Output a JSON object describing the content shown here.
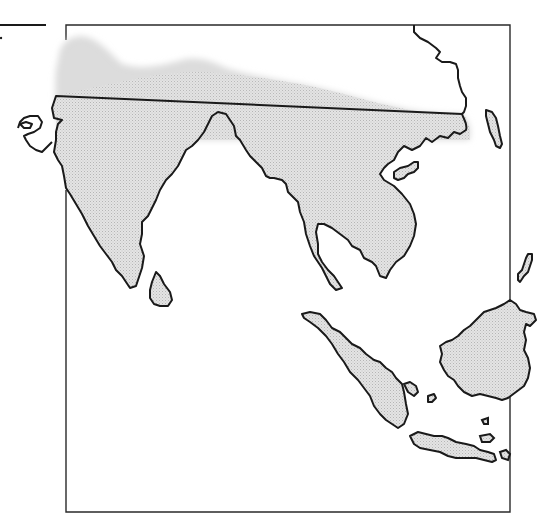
{
  "map": {
    "title": "South and Southeast Asia outline map",
    "shaded_region_label": "Shaded distribution area",
    "colors": {
      "background": "#ffffff",
      "coastline": "#1a1a1a",
      "frame": "#2a2a2a",
      "shade": "#d9d9d9"
    },
    "regions": [
      "Indian subcontinent",
      "Sri Lanka",
      "Indochina",
      "Malay Peninsula",
      "Hainan",
      "Taiwan",
      "Sumatra",
      "Java",
      "Borneo",
      "Philippines (partial)",
      "Arabian coast (partial)"
    ]
  }
}
